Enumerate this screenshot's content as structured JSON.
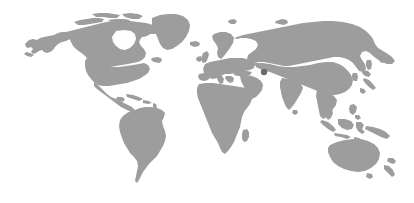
{
  "figure": {
    "kind": "world-map",
    "caption": "Grey world map silhouette on a white background with one dark marker dot in Central Asia",
    "width": 414,
    "height": 203,
    "projection": "equirectangular"
  },
  "colors": {
    "background": "#ffffff",
    "land": "#9d9d9d",
    "land_light": "#a8a8a8",
    "marker": "#6a6a6a"
  },
  "map_extent": {
    "lon_min": -169,
    "lon_max": 190,
    "lat_min": -56,
    "lat_max": 84,
    "pixel_left": 25,
    "pixel_right": 398,
    "pixel_top": 12,
    "pixel_bottom": 182
  },
  "markers": [
    {
      "name": "highlighted-location",
      "label": "",
      "region": "Central Asia",
      "x": 264,
      "y": 72,
      "radius": 3.2,
      "color": "#6a6a6a"
    }
  ],
  "regions": [
    {
      "name": "alaska",
      "label": "Alaska"
    },
    {
      "name": "canada",
      "label": "Canada"
    },
    {
      "name": "canadian-arctic",
      "label": "Canadian Arctic Archipelago"
    },
    {
      "name": "greenland",
      "label": "Greenland"
    },
    {
      "name": "united-states",
      "label": "United States"
    },
    {
      "name": "mexico-central-america",
      "label": "Mexico and Central America"
    },
    {
      "name": "caribbean",
      "label": "Caribbean"
    },
    {
      "name": "south-america",
      "label": "South America"
    },
    {
      "name": "iceland",
      "label": "Iceland"
    },
    {
      "name": "british-isles",
      "label": "British Isles"
    },
    {
      "name": "europe",
      "label": "Europe"
    },
    {
      "name": "scandinavia",
      "label": "Scandinavia"
    },
    {
      "name": "africa",
      "label": "Africa"
    },
    {
      "name": "madagascar",
      "label": "Madagascar"
    },
    {
      "name": "middle-east",
      "label": "Middle East"
    },
    {
      "name": "russia-asia",
      "label": "Russia and Asia"
    },
    {
      "name": "india",
      "label": "India"
    },
    {
      "name": "china-east-asia",
      "label": "China and East Asia"
    },
    {
      "name": "japan",
      "label": "Japan"
    },
    {
      "name": "korea",
      "label": "Korean Peninsula"
    },
    {
      "name": "southeast-asia",
      "label": "Southeast Asia"
    },
    {
      "name": "indonesia",
      "label": "Indonesian Archipelago"
    },
    {
      "name": "philippines",
      "label": "Philippines"
    },
    {
      "name": "new-guinea",
      "label": "New Guinea"
    },
    {
      "name": "australia",
      "label": "Australia"
    },
    {
      "name": "new-zealand",
      "label": "New Zealand"
    },
    {
      "name": "tasmania",
      "label": "Tasmania"
    },
    {
      "name": "sri-lanka",
      "label": "Sri Lanka"
    }
  ]
}
